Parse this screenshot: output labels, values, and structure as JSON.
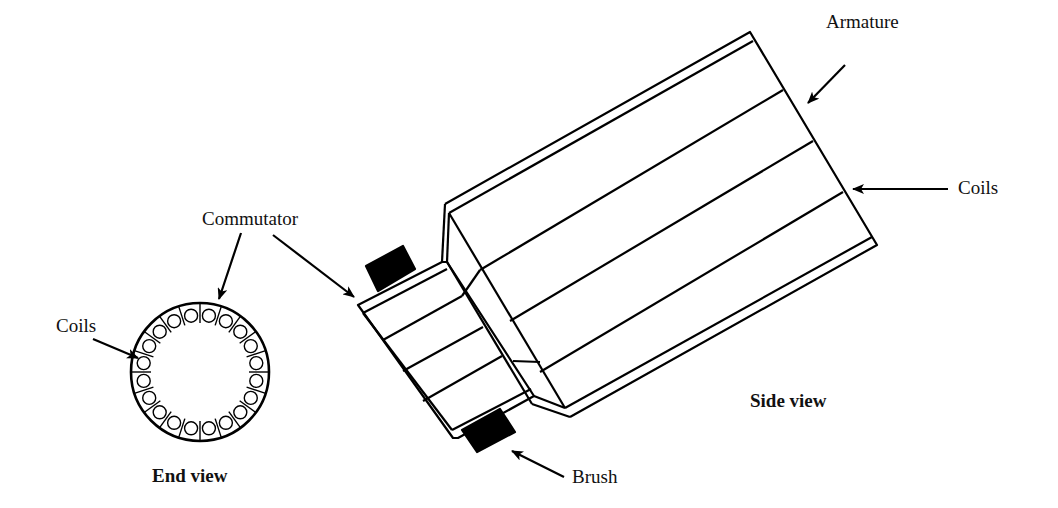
{
  "diagram": {
    "stroke_color": "#000000",
    "background": "#ffffff",
    "labels": {
      "armature": "Armature",
      "coils_side": "Coils",
      "commutator": "Commutator",
      "coils_end": "Coils",
      "brush": "Brush",
      "side_view": "Side view",
      "end_view": "End view"
    },
    "end_view": {
      "center": [
        200,
        372
      ],
      "radius": 69,
      "coil_count": 20,
      "divider_count": 20
    },
    "side_view": {
      "armature_segments": 4,
      "commutator_segments": 4,
      "brush_count": 2
    }
  }
}
